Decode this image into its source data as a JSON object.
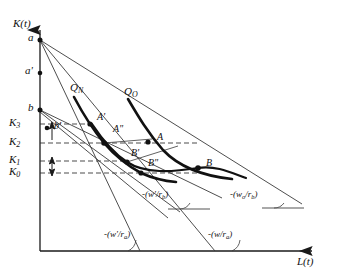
{
  "figure": {
    "type": "economics-isoquant-diagram",
    "axes": {
      "y_label": "K(t)",
      "x_label": "L(t)",
      "origin_px": [
        40,
        251
      ],
      "y_top_px": 22,
      "x_right_px": 322
    },
    "colors": {
      "ink": "#1a1a1a",
      "thin": "#3a3a3a",
      "dash": "#2b2b2b",
      "background": "#ffffff"
    },
    "axis_points": [
      {
        "name": "a",
        "label": "a",
        "x": 40,
        "y": 40,
        "dot": true
      },
      {
        "name": "a-prime",
        "label": "a'",
        "x": 40,
        "y": 73,
        "dot": true
      },
      {
        "name": "b",
        "label": "b",
        "x": 40,
        "y": 110,
        "dot": true
      },
      {
        "name": "b-prime",
        "label": "b'",
        "x": 47,
        "y": 128,
        "dot": true
      }
    ],
    "k_levels": [
      {
        "name": "K3",
        "label": "K",
        "sub": "3",
        "y": 124
      },
      {
        "name": "K2",
        "label": "K",
        "sub": "2",
        "y": 143
      },
      {
        "name": "K1",
        "label": "K",
        "sub": "1",
        "y": 161
      },
      {
        "name": "K0",
        "label": "K",
        "sub": "0",
        "y": 173
      }
    ],
    "isoquants": [
      {
        "name": "Q-N",
        "label": "Q",
        "sub": "N",
        "label_x": 70,
        "label_y": 88
      },
      {
        "name": "Q-O",
        "label": "Q",
        "sub": "O",
        "label_x": 124,
        "label_y": 92
      }
    ],
    "tangency_points": [
      {
        "name": "A-prime",
        "label": "A'",
        "x": 90,
        "y": 124,
        "lx": 97,
        "ly": 118
      },
      {
        "name": "A-double-prime",
        "label": "A\"",
        "x": 104,
        "y": 143,
        "lx": 113,
        "ly": 130
      },
      {
        "name": "A",
        "label": "A",
        "x": 148,
        "y": 142,
        "lx": 155,
        "ly": 134
      },
      {
        "name": "B-prime",
        "label": "B'",
        "x": 127,
        "y": 162,
        "lx": 131,
        "ly": 153
      },
      {
        "name": "B-double-prime",
        "label": "B\"",
        "x": 141,
        "y": 173,
        "lx": 148,
        "ly": 160
      },
      {
        "name": "B",
        "label": "B",
        "x": 198,
        "y": 168,
        "lx": 205,
        "ly": 160
      }
    ],
    "slope_labels": [
      {
        "name": "slope-w-prime-rb",
        "text": "-(w'/r",
        "sub": "b",
        "tail": ")",
        "x": 142,
        "y": 196
      },
      {
        "name": "slope-wo-rb",
        "text": "-(w",
        "subo": "o",
        "mid": "/r",
        "sub": "b",
        "tail": ")",
        "x": 232,
        "y": 196
      },
      {
        "name": "slope-w-prime-ra",
        "text": "-(w'/r",
        "sub": "a",
        "tail": ")",
        "x": 106,
        "y": 236
      },
      {
        "name": "slope-w-ra",
        "text": "-(w/r",
        "sub": "a",
        "tail": ")",
        "x": 210,
        "y": 236
      }
    ]
  }
}
